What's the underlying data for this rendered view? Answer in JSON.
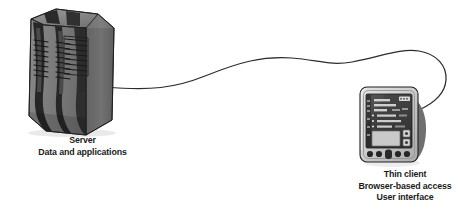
{
  "diagram": {
    "background_color": "#ffffff",
    "nodes": [
      {
        "id": "server",
        "icon": "server-tower-icon",
        "caption_lines": [
          "Server",
          "Data and applications"
        ]
      },
      {
        "id": "thin-client",
        "icon": "thin-client-device-icon",
        "caption_lines": [
          "Thin client",
          "Browser-based access",
          "User interface"
        ]
      }
    ],
    "connector": {
      "id": "network-cable",
      "style": "curved-line",
      "color": "#2b2b2b"
    }
  },
  "server": {
    "caption": {
      "line1": "Server",
      "line2": "Data and applications"
    }
  },
  "thin_client": {
    "caption": {
      "line1": "Thin client",
      "line2": "Browser-based access",
      "line3": "User interface"
    }
  },
  "colors": {
    "body_gray": "#7e7e7e",
    "body_gray_light": "#949494",
    "body_gray_dark": "#5d5d5d",
    "shadow_dark": "#3a3a3a",
    "near_black": "#232323",
    "screen_dark": "#3f3f3f",
    "bezel_light": "#d8d8d8",
    "bezel_mid": "#b4b4b4",
    "text": "#1b1b1b",
    "cable": "#2b2b2b",
    "outline": "#1f1f1f"
  }
}
